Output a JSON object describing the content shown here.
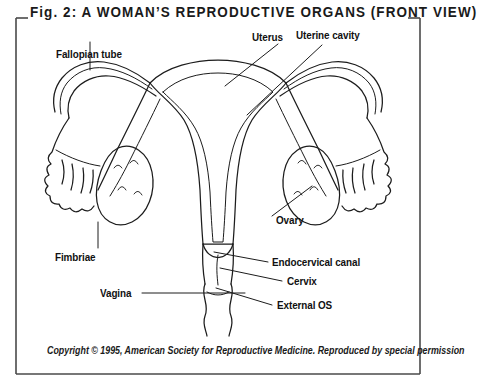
{
  "figure": {
    "title": "Fig. 2: A WOMAN’S REPRODUCTIVE ORGANS (FRONT VIEW)",
    "copyright": "Copyright © 1995, American Society for Reproductive Medicine. Reproduced by special permission",
    "frame_color": "#4a4a4a",
    "ink_color": "#1c1c1c",
    "background_color": "#ffffff"
  },
  "labels": {
    "fallopian_tube": "Fallopian tube",
    "uterus": "Uterus",
    "uterine_cavity": "Uterine cavity",
    "ovary": "Ovary",
    "fimbriae": "Fimbriae",
    "endocervical_canal": "Endocervical canal",
    "cervix": "Cervix",
    "external_os": "External OS",
    "vagina": "Vagina"
  }
}
